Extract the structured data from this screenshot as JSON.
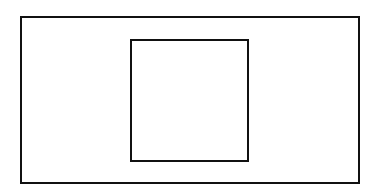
{
  "diagram": {
    "background": "#ffffff",
    "stroke_color": "#111111",
    "shapes": [
      {
        "name": "outer-rectangle",
        "left": 20,
        "top": 16,
        "width": 340,
        "height": 168,
        "stroke_width": 2
      },
      {
        "name": "inner-square",
        "left": 130,
        "top": 39,
        "width": 119,
        "height": 123,
        "stroke_width": 2
      }
    ]
  }
}
